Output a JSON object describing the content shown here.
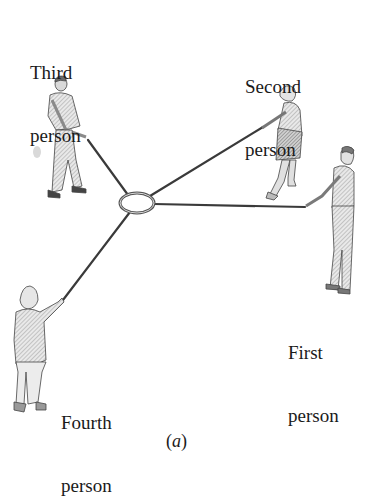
{
  "diagram": {
    "labels": {
      "first": {
        "line1": "First",
        "line2": "person"
      },
      "second": {
        "line1": "Second",
        "line2": "person"
      },
      "third": {
        "line1": "Third",
        "line2": "person"
      },
      "fourth": {
        "line1": "Fourth",
        "line2": "person"
      }
    },
    "caption": {
      "open": "(",
      "letter": "a",
      "close": ")"
    },
    "ring": {
      "cx": 137,
      "cy": 203,
      "rx": 17,
      "ry": 10
    },
    "ropes": [
      {
        "to": "first",
        "x2": 305,
        "y2": 207
      },
      {
        "to": "second",
        "x2": 263,
        "y2": 127
      },
      {
        "to": "third",
        "x2": 88,
        "y2": 140
      },
      {
        "to": "fourth",
        "x2": 63,
        "y2": 300
      }
    ],
    "colors": {
      "ink": "#1a1a1a",
      "rope": "#3a3a3a",
      "shade": "#9a9a9a",
      "light": "#cfcfcf"
    }
  }
}
